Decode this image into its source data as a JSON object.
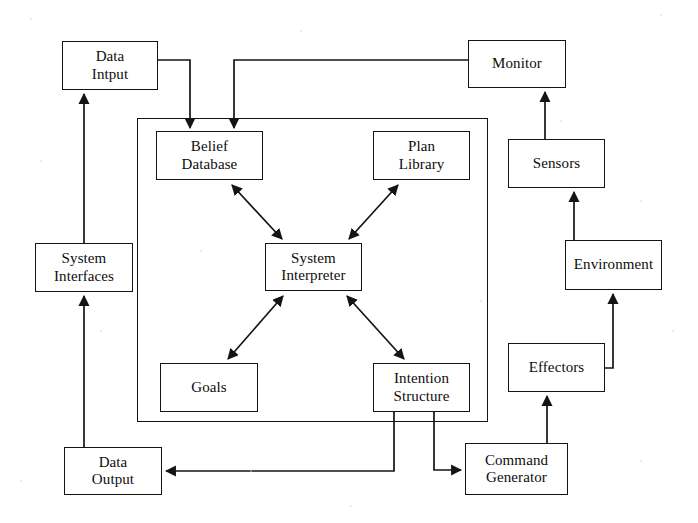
{
  "diagram": {
    "line_color": "#141414",
    "background_color": "#ffffff",
    "text_color": "#0d0d0d",
    "nodes": [
      {
        "id": "data-input",
        "label": "Data\nIntput",
        "x": 62,
        "y": 41,
        "w": 96,
        "h": 49
      },
      {
        "id": "monitor",
        "label": "Monitor",
        "x": 468,
        "y": 40,
        "w": 98,
        "h": 48
      },
      {
        "id": "belief-database",
        "label": "Belief\nDatabase",
        "x": 156,
        "y": 131,
        "w": 107,
        "h": 49
      },
      {
        "id": "plan-library",
        "label": "Plan\nLibrary",
        "x": 373,
        "y": 131,
        "w": 97,
        "h": 49
      },
      {
        "id": "sensors",
        "label": "Sensors",
        "x": 508,
        "y": 139,
        "w": 97,
        "h": 49
      },
      {
        "id": "system-interfaces",
        "label": "System\nInterfaces",
        "x": 35,
        "y": 243,
        "w": 98,
        "h": 49
      },
      {
        "id": "system-interpreter",
        "label": "System\nInterpreter",
        "x": 265,
        "y": 243,
        "w": 97,
        "h": 48
      },
      {
        "id": "environment",
        "label": "Environment",
        "x": 565,
        "y": 240,
        "w": 97,
        "h": 50
      },
      {
        "id": "effectors",
        "label": "Effectors",
        "x": 508,
        "y": 343,
        "w": 97,
        "h": 49
      },
      {
        "id": "goals",
        "label": "Goals",
        "x": 160,
        "y": 363,
        "w": 98,
        "h": 49
      },
      {
        "id": "intention-structure",
        "label": "Intention\nStructure",
        "x": 373,
        "y": 363,
        "w": 97,
        "h": 49
      },
      {
        "id": "data-output",
        "label": "Data\nOutput",
        "x": 64,
        "y": 447,
        "w": 98,
        "h": 48
      },
      {
        "id": "command-generator",
        "label": "Command\nGenerator",
        "x": 465,
        "y": 443,
        "w": 103,
        "h": 52
      }
    ],
    "frame": {
      "id": "agent-boundary",
      "label": "agent-boundary-frame",
      "x": 137,
      "y": 118,
      "w": 351,
      "h": 304
    },
    "edges": [
      {
        "id": "data-input-to-belief-database",
        "from": "data-input",
        "to": "belief-database",
        "kind": "orthogonal",
        "arrows": "end"
      },
      {
        "id": "monitor-to-belief-database",
        "from": "monitor",
        "to": "belief-database",
        "kind": "orthogonal",
        "arrows": "end"
      },
      {
        "id": "belief-database-to-system-interpreter",
        "from": "belief-database",
        "to": "system-interpreter",
        "kind": "diagonal",
        "arrows": "both"
      },
      {
        "id": "plan-library-to-system-interpreter",
        "from": "plan-library",
        "to": "system-interpreter",
        "kind": "diagonal",
        "arrows": "both"
      },
      {
        "id": "goals-to-system-interpreter",
        "from": "goals",
        "to": "system-interpreter",
        "kind": "diagonal",
        "arrows": "both"
      },
      {
        "id": "intention-to-system-interpreter",
        "from": "intention-structure",
        "to": "system-interpreter",
        "kind": "diagonal",
        "arrows": "both"
      },
      {
        "id": "intention-to-data-output",
        "from": "intention-structure",
        "to": "data-output",
        "kind": "orthogonal",
        "arrows": "end"
      },
      {
        "id": "intention-to-command-generator",
        "from": "intention-structure",
        "to": "command-generator",
        "kind": "orthogonal",
        "arrows": "end"
      },
      {
        "id": "command-generator-to-effectors",
        "from": "command-generator",
        "to": "effectors",
        "kind": "straight",
        "arrows": "end"
      },
      {
        "id": "effectors-to-environment",
        "from": "effectors",
        "to": "environment",
        "kind": "orthogonal",
        "arrows": "end"
      },
      {
        "id": "environment-to-sensors",
        "from": "environment",
        "to": "sensors",
        "kind": "orthogonal",
        "arrows": "end"
      },
      {
        "id": "sensors-to-monitor",
        "from": "sensors",
        "to": "monitor",
        "kind": "straight",
        "arrows": "end"
      },
      {
        "id": "data-output-to-system-interfaces",
        "from": "data-output",
        "to": "system-interfaces",
        "kind": "straight",
        "arrows": "end"
      },
      {
        "id": "system-interfaces-to-data-input",
        "from": "system-interfaces",
        "to": "data-input",
        "kind": "straight",
        "arrows": "end"
      }
    ]
  }
}
